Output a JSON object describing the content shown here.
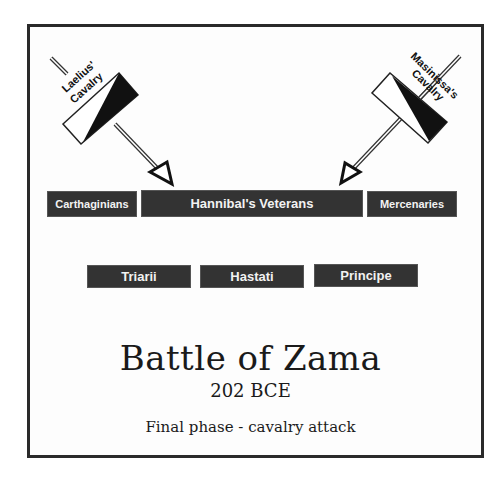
{
  "diagram": {
    "title": "Battle of Zama",
    "date": "202 BCE",
    "subtitle": "Final phase - cavalry attack",
    "cavalry": [
      {
        "label_line1": "Laelius'",
        "label_line2": "Cavalry",
        "side": "left"
      },
      {
        "label_line1": "Masinissa's",
        "label_line2": "Cavalry",
        "side": "right"
      }
    ],
    "front_line": [
      "Carthaginians",
      "Hannibal's Veterans",
      "Mercenaries"
    ],
    "rear_line": [
      "Triarii",
      "Hastati",
      "Principe"
    ],
    "colors": {
      "unit_fill": "#333333",
      "unit_text": "#f2f2f2",
      "frame": "#2a2a2a",
      "background": "#ffffff"
    }
  }
}
